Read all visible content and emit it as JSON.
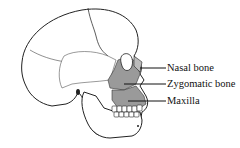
{
  "diagram": {
    "labels": [
      {
        "text": "Nasal bone",
        "x": 167,
        "y": 63
      },
      {
        "text": "Zygomatic bone",
        "x": 167,
        "y": 79
      },
      {
        "text": "Maxilla",
        "x": 167,
        "y": 96
      }
    ],
    "colors": {
      "outline": "#222222",
      "highlight": "#9a9a9a",
      "background": "#ffffff"
    }
  }
}
